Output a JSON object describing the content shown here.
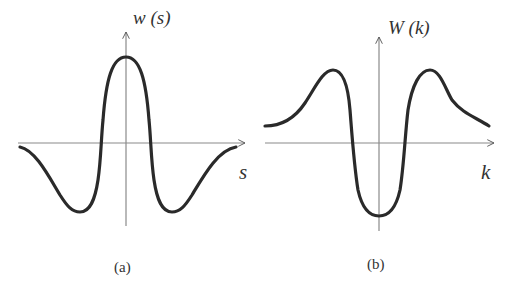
{
  "figure": {
    "panels": [
      {
        "id": "a",
        "caption": "(a)",
        "y_label": "w (s)",
        "x_label": "s",
        "description": "Mexican-hat shaped wavelet: central positive peak with two negative side lobes that return toward zero",
        "curve_points": [
          [
            -1.0,
            -0.06
          ],
          [
            -0.85,
            -0.25
          ],
          [
            -0.6,
            -0.86
          ],
          [
            -0.5,
            -0.92
          ],
          [
            -0.4,
            -0.8
          ],
          [
            -0.22,
            0.0
          ],
          [
            -0.12,
            0.82
          ],
          [
            0.0,
            1.0
          ],
          [
            0.12,
            0.82
          ],
          [
            0.22,
            0.0
          ],
          [
            0.4,
            -0.8
          ],
          [
            0.5,
            -0.92
          ],
          [
            0.6,
            -0.86
          ],
          [
            0.85,
            -0.25
          ],
          [
            1.0,
            -0.06
          ]
        ]
      },
      {
        "id": "b",
        "caption": "(b)",
        "y_label": "W (k)",
        "x_label": "k",
        "description": "Transform: deep negative central trough flanked by two positive peaks decaying to a positive baseline",
        "curve_points": [
          [
            -1.0,
            0.23
          ],
          [
            -0.75,
            0.45
          ],
          [
            -0.42,
            0.95
          ],
          [
            -0.28,
            0.6
          ],
          [
            -0.24,
            0.0
          ],
          [
            -0.15,
            -0.7
          ],
          [
            0.0,
            -0.95
          ],
          [
            0.15,
            -0.7
          ],
          [
            0.24,
            0.0
          ],
          [
            0.32,
            0.6
          ],
          [
            0.45,
            0.95
          ],
          [
            0.6,
            0.55
          ],
          [
            1.0,
            0.23
          ]
        ]
      }
    ]
  }
}
